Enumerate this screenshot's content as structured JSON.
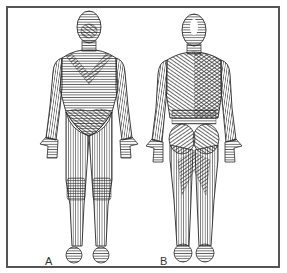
{
  "figure": {
    "panels": [
      {
        "label": "A",
        "view": "anterior"
      },
      {
        "label": "B",
        "view": "posterior"
      }
    ],
    "colors": {
      "ink": "#2a2a2a",
      "frame": "#555555",
      "background": "#ffffff"
    }
  }
}
